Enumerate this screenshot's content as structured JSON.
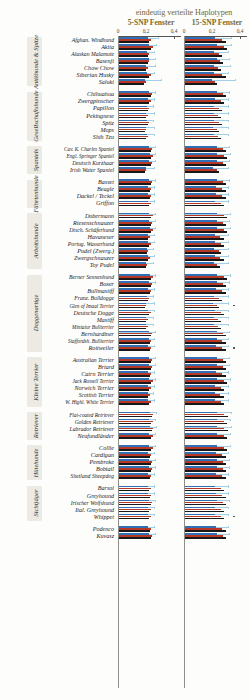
{
  "header": {
    "title": "eindeutig verteilte Haplotypen",
    "panel_a_label": "5-SNP Fenster",
    "panel_b_label": "15-SNP Fenster",
    "title_color": "#7a6a2a"
  },
  "axis": {
    "ticks": [
      "0",
      "0,2",
      "0,4"
    ],
    "tick_values": [
      0,
      0.2,
      0.4
    ],
    "min": 0,
    "max": 0.45
  },
  "legend_colors": {
    "series_blue": "#2f6fb5",
    "series_red": "#b93725",
    "series_black": "#18181a",
    "error_bar": "#9fd0e8"
  },
  "groups": [
    {
      "label": "Antikhunde & Spitze",
      "start": 0,
      "count": 7
    },
    {
      "label": "Gesellschaftshunde",
      "start": 7,
      "count": 7
    },
    {
      "label": "Spaniels",
      "start": 14,
      "count": 4
    },
    {
      "label": "Fährtenhunde",
      "start": 18,
      "count": 4
    },
    {
      "label": "Arbeitshunde",
      "start": 22,
      "count": 8
    },
    {
      "label": "Doggenartige",
      "start": 30,
      "count": 11
    },
    {
      "label": "Kleine Terrier",
      "start": 41,
      "count": 7
    },
    {
      "label": "Retriever",
      "start": 48,
      "count": 4
    },
    {
      "label": "Hütehunde",
      "start": 52,
      "count": 5
    },
    {
      "label": "Sichtjäger",
      "start": 57,
      "count": 5
    },
    {
      "label": "",
      "start": 62,
      "count": 2
    }
  ],
  "chart_data": {
    "type": "bar",
    "orientation": "horizontal",
    "title": "eindeutig verteilte Haplotypen",
    "xlabel": "",
    "ylabel": "",
    "xlim": [
      0,
      0.45
    ],
    "xticks": [
      0,
      0.2,
      0.4
    ],
    "grid": false,
    "legend_position": "none",
    "panels": [
      "5-SNP Fenster",
      "15-SNP Fenster"
    ],
    "series": [
      {
        "name": "blau",
        "color": "#2f6fb5"
      },
      {
        "name": "rot",
        "color": "#b93725"
      },
      {
        "name": "schwarz",
        "color": "#18181a"
      }
    ],
    "categories": [
      "Afghan. Windhund",
      "Akita",
      "Alaskan Malamute",
      "Basenji",
      "Chow Chow",
      "Siberian Husky",
      "Saluki",
      "Chihuahua",
      "Zwergpinscher",
      "Papillon",
      "Pekingnese",
      "Spitz",
      "Mops",
      "Shih Tzu",
      "Cav. K. Charles Spaniel",
      "Engl. Springer Spaniel",
      "Deutsch Kurzhaar",
      "Irish Water Spaniel",
      "Basset",
      "Beagle",
      "Dackel / Teckel",
      "Griffon",
      "Dobermann",
      "Riesenschnauzer",
      "Dtsch. Schäferhund",
      "Havaneser",
      "Portug. Wasserhund",
      "Pudel (Zwerg.)",
      "Zwergschnauzer",
      "Toy Pudel",
      "Berner Sennenhund",
      "Boxer",
      "Bullmastiff",
      "Franz. Bulldogge",
      "Glen of Imaal Terrier",
      "Deutsche Dogge",
      "Mastiff",
      "Miniatur Bullterrier",
      "Bernhardiner",
      "Staffordsh. Bullterrier",
      "Rottweiler",
      "Australian Terrier",
      "Briard",
      "Cairn Terrier",
      "Jack Russell Terrier",
      "Norwich Terrier",
      "Scottish Terrier",
      "W. Highl. White Terrier",
      "Flat-coated Retriever",
      "Golden Retriever",
      "Labrador Retriever",
      "Neufundländer",
      "Collie",
      "Cardigan",
      "Pembroke",
      "Bobtail",
      "Shetland Sheepdog",
      "Barsoi",
      "Greyhound",
      "Irischer Wolfshund",
      "Ital. Greyhound",
      "Whippet",
      "Podenco",
      "Kuvasz"
    ],
    "panel_a": {
      "blue": [
        0.205,
        0.215,
        0.2,
        0.215,
        0.195,
        0.2,
        0.185,
        0.215,
        0.205,
        0.2,
        0.195,
        0.2,
        0.19,
        0.2,
        0.215,
        0.22,
        0.215,
        0.19,
        0.215,
        0.21,
        0.21,
        0.205,
        0.215,
        0.215,
        0.22,
        0.205,
        0.205,
        0.2,
        0.205,
        0.195,
        0.22,
        0.215,
        0.21,
        0.2,
        0.19,
        0.205,
        0.195,
        0.195,
        0.215,
        0.215,
        0.21,
        0.215,
        0.215,
        0.21,
        0.215,
        0.205,
        0.205,
        0.205,
        0.22,
        0.215,
        0.22,
        0.215,
        0.215,
        0.21,
        0.215,
        0.215,
        0.21,
        0.205,
        0.21,
        0.215,
        0.205,
        0.205,
        0.21,
        0.215
      ],
      "red": [
        0.23,
        0.24,
        0.215,
        0.215,
        0.205,
        0.23,
        0.19,
        0.235,
        0.225,
        0.215,
        0.205,
        0.215,
        0.195,
        0.205,
        0.235,
        0.24,
        0.235,
        0.195,
        0.235,
        0.23,
        0.23,
        0.225,
        0.24,
        0.235,
        0.24,
        0.22,
        0.225,
        0.21,
        0.22,
        0.2,
        0.24,
        0.235,
        0.23,
        0.215,
        0.195,
        0.225,
        0.205,
        0.205,
        0.235,
        0.23,
        0.23,
        0.235,
        0.235,
        0.23,
        0.24,
        0.225,
        0.22,
        0.225,
        0.245,
        0.24,
        0.245,
        0.24,
        0.24,
        0.23,
        0.235,
        0.235,
        0.23,
        0.225,
        0.23,
        0.235,
        0.225,
        0.225,
        0.23,
        0.235
      ],
      "black": [
        0.215,
        0.23,
        0.205,
        0.205,
        0.195,
        0.215,
        0.18,
        0.225,
        0.215,
        0.205,
        0.195,
        0.205,
        0.185,
        0.195,
        0.225,
        0.23,
        0.225,
        0.185,
        0.225,
        0.22,
        0.22,
        0.215,
        0.23,
        0.225,
        0.23,
        0.21,
        0.215,
        0.2,
        0.21,
        0.19,
        0.23,
        0.225,
        0.22,
        0.205,
        0.185,
        0.215,
        0.195,
        0.195,
        0.225,
        0.22,
        0.22,
        0.225,
        0.225,
        0.22,
        0.23,
        0.215,
        0.21,
        0.215,
        0.235,
        0.23,
        0.235,
        0.23,
        0.23,
        0.22,
        0.225,
        0.225,
        0.22,
        0.215,
        0.22,
        0.225,
        0.215,
        0.215,
        0.22,
        0.225
      ],
      "err_hi": [
        0.275,
        0.265,
        0.25,
        0.255,
        0.26,
        0.25,
        0.3,
        0.255,
        0.25,
        0.245,
        0.25,
        0.245,
        0.25,
        0.25,
        0.255,
        0.26,
        0.255,
        0.25,
        0.255,
        0.25,
        0.25,
        0.25,
        0.26,
        0.255,
        0.26,
        0.25,
        0.25,
        0.245,
        0.25,
        0.245,
        0.26,
        0.255,
        0.25,
        0.245,
        0.25,
        0.25,
        0.245,
        0.245,
        0.255,
        0.25,
        0.25,
        0.255,
        0.255,
        0.25,
        0.26,
        0.25,
        0.245,
        0.25,
        0.265,
        0.26,
        0.265,
        0.26,
        0.26,
        0.25,
        0.255,
        0.255,
        0.25,
        0.25,
        0.25,
        0.255,
        0.25,
        0.25,
        0.25,
        0.255
      ]
    },
    "panel_b": {
      "blue": [
        0.215,
        0.225,
        0.21,
        0.225,
        0.205,
        0.21,
        0.195,
        0.225,
        0.215,
        0.21,
        0.205,
        0.21,
        0.2,
        0.21,
        0.225,
        0.23,
        0.225,
        0.2,
        0.225,
        0.22,
        0.22,
        0.215,
        0.225,
        0.225,
        0.23,
        0.215,
        0.215,
        0.21,
        0.215,
        0.205,
        0.23,
        0.225,
        0.22,
        0.21,
        0.2,
        0.215,
        0.205,
        0.205,
        0.225,
        0.225,
        0.22,
        0.225,
        0.225,
        0.22,
        0.225,
        0.215,
        0.215,
        0.215,
        0.23,
        0.225,
        0.23,
        0.225,
        0.225,
        0.22,
        0.225,
        0.225,
        0.22,
        0.215,
        0.22,
        0.225,
        0.215,
        0.215,
        0.22,
        0.225
      ],
      "red": [
        0.265,
        0.275,
        0.245,
        0.25,
        0.235,
        0.265,
        0.215,
        0.27,
        0.255,
        0.245,
        0.235,
        0.245,
        0.225,
        0.235,
        0.27,
        0.275,
        0.27,
        0.225,
        0.27,
        0.265,
        0.265,
        0.255,
        0.275,
        0.27,
        0.275,
        0.25,
        0.255,
        0.24,
        0.25,
        0.23,
        0.275,
        0.27,
        0.265,
        0.245,
        0.225,
        0.255,
        0.235,
        0.235,
        0.27,
        0.265,
        0.265,
        0.27,
        0.27,
        0.265,
        0.275,
        0.255,
        0.25,
        0.255,
        0.28,
        0.275,
        0.28,
        0.275,
        0.275,
        0.265,
        0.27,
        0.27,
        0.265,
        0.255,
        0.265,
        0.27,
        0.255,
        0.255,
        0.265,
        0.27
      ],
      "black": [
        0.29,
        0.3,
        0.265,
        0.27,
        0.255,
        0.29,
        0.23,
        0.295,
        0.28,
        0.265,
        0.255,
        0.265,
        0.24,
        0.255,
        0.295,
        0.3,
        0.295,
        0.24,
        0.295,
        0.29,
        0.29,
        0.28,
        0.3,
        0.295,
        0.3,
        0.275,
        0.28,
        0.26,
        0.275,
        0.25,
        0.3,
        0.295,
        0.29,
        0.265,
        0.24,
        0.28,
        0.255,
        0.255,
        0.295,
        0.29,
        0.29,
        0.295,
        0.295,
        0.29,
        0.3,
        0.28,
        0.275,
        0.28,
        0.305,
        0.3,
        0.305,
        0.3,
        0.3,
        0.29,
        0.295,
        0.295,
        0.29,
        0.28,
        0.29,
        0.295,
        0.28,
        0.28,
        0.29,
        0.295
      ],
      "err_hi": [
        0.33,
        0.325,
        0.31,
        0.315,
        0.32,
        0.31,
        0.355,
        0.315,
        0.31,
        0.305,
        0.31,
        0.305,
        0.31,
        0.31,
        0.315,
        0.32,
        0.315,
        0.31,
        0.315,
        0.31,
        0.31,
        0.31,
        0.32,
        0.315,
        0.32,
        0.31,
        0.31,
        0.305,
        0.31,
        0.305,
        0.32,
        0.315,
        0.31,
        0.305,
        0.31,
        0.31,
        0.305,
        0.305,
        0.315,
        0.31,
        0.31,
        0.315,
        0.315,
        0.31,
        0.32,
        0.31,
        0.305,
        0.31,
        0.325,
        0.32,
        0.325,
        0.32,
        0.32,
        0.31,
        0.315,
        0.315,
        0.31,
        0.31,
        0.31,
        0.315,
        0.31,
        0.31,
        0.31,
        0.315
      ]
    },
    "outliers_panel_b": [
      34,
      40,
      61
    ]
  }
}
